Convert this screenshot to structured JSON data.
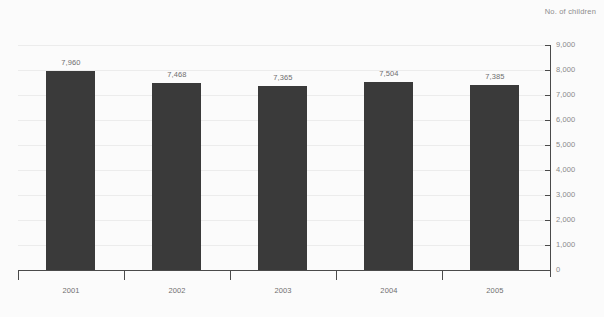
{
  "chart_data": {
    "type": "bar",
    "title": "",
    "subtitle": "",
    "unit_label": "No. of children",
    "xlabel": "",
    "ylabel": "",
    "categories": [
      "2001",
      "2002",
      "2003",
      "2004",
      "2005"
    ],
    "values": [
      7960,
      7468,
      7365,
      7504,
      7385
    ],
    "value_labels": [
      "7,960",
      "7,468",
      "7,365",
      "7,504",
      "7,385"
    ],
    "ylim": [
      0,
      9000
    ],
    "y_tick_step": 1000,
    "y_tick_labels": [
      "9,000",
      "8,000",
      "7,000",
      "6,000",
      "5,000",
      "4,000",
      "3,000",
      "2,000",
      "1,000",
      "0"
    ],
    "y_tick_values": [
      9000,
      8000,
      7000,
      6000,
      5000,
      4000,
      3000,
      2000,
      1000,
      0
    ],
    "grid": true,
    "legend": "none",
    "y_axis_position": "right",
    "colors": {
      "bar": "#3a3a3a",
      "background": "#fbfbfb",
      "gridline": "#ececec",
      "axis": "#4a4a4a",
      "tick_label": "#8a8a8a",
      "value_label": "#6f6f6f"
    }
  }
}
